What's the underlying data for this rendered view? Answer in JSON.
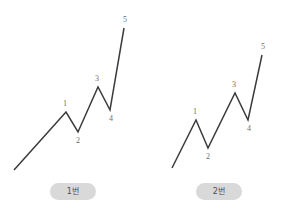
{
  "canvas": {
    "width": 292,
    "height": 224,
    "background": "#ffffff",
    "line_color": "#3b3b3b",
    "label_color": "#6e6e6e",
    "pill_background": "#d9d9d9",
    "pill_text_color": "#4f4f4f"
  },
  "panels": [
    {
      "id": "panel-left",
      "caption": "1번",
      "point_labels": [
        "1",
        "2",
        "3",
        "4",
        "5"
      ]
    },
    {
      "id": "panel-right",
      "caption": "2번",
      "point_labels": [
        "1",
        "2",
        "3",
        "4",
        "5"
      ]
    }
  ],
  "chart_data": [
    {
      "type": "line",
      "title": "1번",
      "xlabel": "",
      "ylabel": "",
      "xlim": [
        0,
        146
      ],
      "ylim": [
        182,
        0
      ],
      "grid": false,
      "legend": "none",
      "note": "Elliott impulse wave, diagram 1: extended wave 5; wave 4 retrace ends near the level of the wave 1 peak.",
      "x": [
        14,
        66,
        78,
        98,
        110,
        124
      ],
      "y": [
        170,
        112,
        132,
        87,
        110,
        28
      ],
      "point_labels": [
        "",
        "1",
        "2",
        "3",
        "4",
        "5"
      ],
      "label_offsets": [
        {
          "dx": 0,
          "dy": 0
        },
        {
          "dx": -1,
          "dy": -6
        },
        {
          "dx": 0,
          "dy": 11
        },
        {
          "dx": -1,
          "dy": -6
        },
        {
          "dx": 1,
          "dy": 11
        },
        {
          "dx": 1,
          "dy": -6
        }
      ]
    },
    {
      "type": "line",
      "title": "2번",
      "xlabel": "",
      "ylabel": "",
      "xlim": [
        0,
        146
      ],
      "ylim": [
        182,
        0
      ],
      "grid": false,
      "legend": "none",
      "note": "Elliott impulse wave, diagram 2: tall steep wave 3; shorter wave 5 than diagram 1.",
      "x": [
        26,
        50,
        62,
        89,
        102,
        116
      ],
      "y": [
        168,
        120,
        148,
        93,
        120,
        55
      ],
      "point_labels": [
        "",
        "1",
        "2",
        "3",
        "4",
        "5"
      ],
      "label_offsets": [
        {
          "dx": 0,
          "dy": 0
        },
        {
          "dx": -1,
          "dy": -6
        },
        {
          "dx": 0,
          "dy": 11
        },
        {
          "dx": -1,
          "dy": -6
        },
        {
          "dx": 1,
          "dy": 11
        },
        {
          "dx": 1,
          "dy": -6
        }
      ]
    }
  ]
}
